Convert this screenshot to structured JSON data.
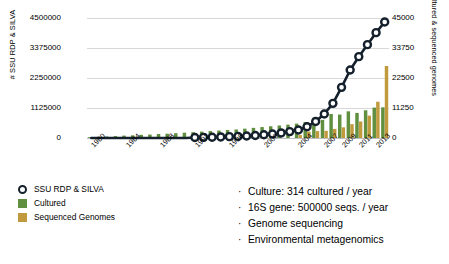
{
  "chart_data": {
    "type": "bar",
    "title": "",
    "xlabel": "",
    "ylabel": "# SSU RDP & SILVA",
    "ylabel_right": "# Cultured & sequenced genomes",
    "ylim": [
      0,
      4500000
    ],
    "ylim_right": [
      0,
      45000
    ],
    "yticks": [
      "0",
      "1125000",
      "2250000",
      "3375000",
      "4500000"
    ],
    "yticks_right": [
      "0",
      "11250",
      "22500",
      "33750",
      "45000"
    ],
    "grid": true,
    "legend_position": "below-left",
    "x": [
      1980,
      1981,
      1982,
      1983,
      1984,
      1985,
      1986,
      1987,
      1988,
      1989,
      1990,
      1991,
      1992,
      1993,
      1994,
      1995,
      1996,
      1997,
      1998,
      1999,
      2000,
      2001,
      2002,
      2003,
      2004,
      2005,
      2006,
      2007,
      2008,
      2009,
      2010,
      2011,
      2012,
      2013,
      2014
    ],
    "xtick_labels": [
      "1980",
      "1984",
      "1988",
      "1992",
      "1996",
      "2000",
      "2004",
      "2007",
      "2009",
      "2011",
      "2013"
    ],
    "xtick_values": [
      1980,
      1984,
      1988,
      1992,
      1996,
      2000,
      2004,
      2007,
      2009,
      2011,
      2013
    ],
    "series": [
      {
        "name": "SSU RDP & SILVA",
        "type": "line",
        "axis": "left",
        "color": "#14202b",
        "marker": "circle-open",
        "values": [
          0,
          0,
          0,
          0,
          0,
          0,
          0,
          0,
          0,
          0,
          0,
          0,
          20000,
          25000,
          30000,
          40000,
          50000,
          60000,
          75000,
          95000,
          120000,
          150000,
          190000,
          240000,
          300000,
          420000,
          620000,
          900000,
          1300000,
          1900000,
          2550000,
          3050000,
          3500000,
          3950000,
          4350000
        ]
      },
      {
        "name": "Cultured",
        "type": "bar",
        "axis": "right",
        "color": "#5f8f3f",
        "values": [
          300,
          400,
          550,
          700,
          900,
          1000,
          1200,
          1300,
          1500,
          1600,
          1800,
          2000,
          2200,
          2400,
          2600,
          2800,
          3000,
          3200,
          3500,
          3800,
          4100,
          4400,
          4700,
          5000,
          5400,
          6000,
          7600,
          6800,
          9000,
          8800,
          10000,
          9400,
          10400,
          11400,
          11500
        ]
      },
      {
        "name": "Sequenced Genomes",
        "type": "bar",
        "axis": "right",
        "color": "#c19a3e",
        "values": [
          0,
          0,
          0,
          0,
          0,
          0,
          0,
          0,
          0,
          0,
          0,
          0,
          0,
          0,
          0,
          0,
          0,
          0,
          0,
          0,
          0,
          0,
          0,
          0,
          1100,
          2400,
          2600,
          2700,
          3400,
          4000,
          5200,
          6200,
          8400,
          13600,
          27000
        ]
      }
    ]
  },
  "axes": {
    "left_label": "# SSU RDP & SILVA",
    "right_label": "# Cultured & sequenced genomes"
  },
  "legend": {
    "items": [
      {
        "label": "SSU RDP & SILVA",
        "color": "#14202b",
        "kind": "marker"
      },
      {
        "label": "Cultured",
        "color": "#5f8f3f",
        "kind": "swatch"
      },
      {
        "label": "Sequenced Genomes",
        "color": "#c19a3e",
        "kind": "swatch"
      }
    ]
  },
  "bullets": {
    "items": [
      "Culture: 314 cultured / year",
      "16S gene: 500000 seqs. / year",
      "Genome sequencing",
      "Environmental metagenomics"
    ],
    "dot": "·"
  }
}
